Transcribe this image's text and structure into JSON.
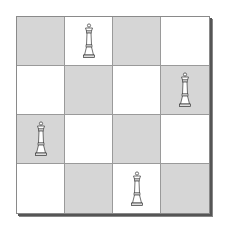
{
  "board": {
    "size": 4,
    "colors": {
      "light": "#ffffff",
      "dark": "#d6d6d6",
      "grid": "#9a9a9a",
      "shadow": "#555555"
    },
    "rows": [
      [
        {
          "color": "dark",
          "piece": null
        },
        {
          "color": "light",
          "piece": "queen"
        },
        {
          "color": "dark",
          "piece": null
        },
        {
          "color": "light",
          "piece": null
        }
      ],
      [
        {
          "color": "light",
          "piece": null
        },
        {
          "color": "dark",
          "piece": null
        },
        {
          "color": "light",
          "piece": null
        },
        {
          "color": "dark",
          "piece": "queen"
        }
      ],
      [
        {
          "color": "dark",
          "piece": "queen"
        },
        {
          "color": "light",
          "piece": null
        },
        {
          "color": "dark",
          "piece": null
        },
        {
          "color": "light",
          "piece": null
        }
      ],
      [
        {
          "color": "light",
          "piece": null
        },
        {
          "color": "dark",
          "piece": null
        },
        {
          "color": "light",
          "piece": "queen"
        },
        {
          "color": "dark",
          "piece": null
        }
      ]
    ],
    "queen_positions": [
      [
        0,
        1
      ],
      [
        1,
        3
      ],
      [
        2,
        0
      ],
      [
        3,
        2
      ]
    ]
  }
}
